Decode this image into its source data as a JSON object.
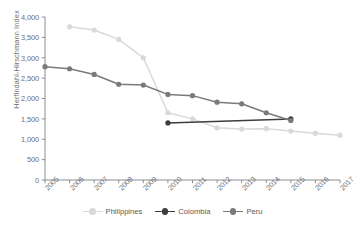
{
  "chart_data": {
    "type": "line",
    "title": "",
    "xlabel": "",
    "ylabel": "Herfindahl-Hirschmann Index",
    "x": [
      2005,
      2006,
      2007,
      2008,
      2009,
      2010,
      2011,
      2012,
      2013,
      2014,
      2015,
      2016,
      2017
    ],
    "xtick_labels": [
      "2005",
      "2006",
      "2007",
      "2008",
      "2009",
      "2010",
      "2011",
      "2012",
      "2013",
      "2014",
      "2015",
      "2016",
      "2017"
    ],
    "ytick_labels": [
      "0",
      "500",
      "1,000",
      "1,500",
      "2,000",
      "2,500",
      "3,000",
      "3,500",
      "4,000"
    ],
    "ylim": [
      0,
      4000
    ],
    "ytick_step": 500,
    "grid": false,
    "legend_position": "bottom-center",
    "series": [
      {
        "name": "Philippines",
        "color": "#d9d9d9",
        "marker": "circle",
        "x": [
          2006,
          2007,
          2008,
          2009,
          2010,
          2011,
          2012,
          2013,
          2014,
          2015,
          2016,
          2017
        ],
        "values": [
          3760,
          3680,
          3450,
          3000,
          1650,
          1500,
          1280,
          1250,
          1260,
          1200,
          1150,
          1100
        ]
      },
      {
        "name": "Colombia",
        "color": "#3d3d3d",
        "marker": "circle",
        "x": [
          2010,
          2015
        ],
        "values": [
          1400,
          1500
        ]
      },
      {
        "name": "Peru",
        "color": "#7a7a7a",
        "marker": "circle",
        "x": [
          2005,
          2006,
          2007,
          2008,
          2009,
          2010,
          2011,
          2012,
          2013,
          2014,
          2015
        ],
        "values": [
          2780,
          2730,
          2590,
          2350,
          2330,
          2100,
          2070,
          1910,
          1870,
          1650,
          1460
        ]
      }
    ]
  },
  "axis": {
    "y_title": "Herfindahl-Hirschmann Index"
  },
  "legend": {
    "items": [
      {
        "label": "Philippines"
      },
      {
        "label": "Colombia"
      },
      {
        "label": "Peru"
      }
    ]
  },
  "colors": {
    "philippines": "#d9d9d9",
    "colombia": "#3d3d3d",
    "peru": "#7a7a7a",
    "axis": "#808285",
    "text": "#6d6e71"
  }
}
